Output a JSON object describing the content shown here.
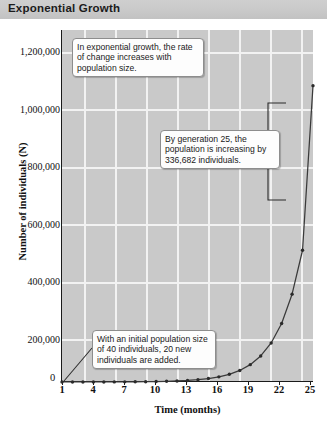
{
  "header": {
    "title": "Exponential Growth"
  },
  "chart_data": {
    "type": "line",
    "title": "Exponential Growth",
    "xlabel": "Time (months)",
    "ylabel": "Number of individuals (N)",
    "xlim": [
      1,
      25
    ],
    "ylim": [
      0,
      1200000
    ],
    "grid": true,
    "legend": "none",
    "xticks": [
      "1",
      "4",
      "7",
      "10",
      "13",
      "16",
      "19",
      "22",
      "25"
    ],
    "yticks": [
      "200,000",
      "400,000",
      "600,000",
      "800,000",
      "1,000,000",
      "1,200,000"
    ],
    "ytick_values": [
      200000,
      400000,
      600000,
      800000,
      1000000,
      1200000
    ],
    "x": [
      1,
      2,
      3,
      4,
      5,
      6,
      7,
      8,
      9,
      10,
      11,
      12,
      13,
      14,
      15,
      16,
      17,
      18,
      19,
      20,
      21,
      22,
      23,
      24,
      25
    ],
    "values": [
      40,
      60,
      90,
      135,
      203,
      304,
      456,
      684,
      1025,
      1538,
      2308,
      3462,
      5192,
      7788,
      11683,
      17524,
      26286,
      39429,
      59144,
      88715,
      133073,
      199609,
      299414,
      449121,
      673681
    ],
    "series": [
      {
        "name": "Population size (N)",
        "values": [
          40,
          60,
          90,
          135,
          203,
          304,
          456,
          684,
          1025,
          1538,
          2308,
          3462,
          5192,
          7788,
          11683,
          17524,
          26286,
          39429,
          59144,
          88715,
          133073,
          199609,
          299414,
          449121,
          673681
        ]
      }
    ],
    "final_point": {
      "x": 25,
      "y": 1010363
    },
    "annotations": [
      {
        "id": "callout-top",
        "text": "In exponential growth, the rate of change increases with population size."
      },
      {
        "id": "callout-mid",
        "text": "By generation 25, the population is increasing by 336,682 individuals."
      },
      {
        "id": "callout-bottom",
        "text": "With an initial population size of 40 individuals, 20 new individuals are added."
      }
    ],
    "bracket": {
      "label": "increase from generation 24 to 25",
      "from": 673681,
      "to": 1010363
    }
  },
  "colors": {
    "header_bg": "#c9c9c9",
    "plot_bg": "#c9c9c9",
    "grid": "#f2f2f2",
    "line": "#3a3a3a",
    "axis": "#1a1a1a"
  }
}
